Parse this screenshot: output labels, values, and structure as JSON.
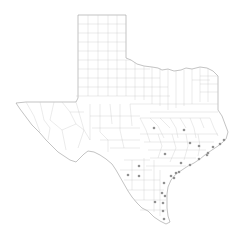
{
  "map": {
    "region": "Texas",
    "subdivision": "counties",
    "colors": {
      "background": "#ffffff",
      "state_outline": "#9a9a9a",
      "county_lines": "#c4c4c4",
      "marker": "#6b6b6b"
    },
    "markers": [
      {
        "x": 154,
        "y": 128
      },
      {
        "x": 184,
        "y": 130
      },
      {
        "x": 190,
        "y": 143
      },
      {
        "x": 199,
        "y": 146
      },
      {
        "x": 165,
        "y": 154
      },
      {
        "x": 213,
        "y": 147
      },
      {
        "x": 220,
        "y": 144
      },
      {
        "x": 224,
        "y": 140
      },
      {
        "x": 207,
        "y": 155
      },
      {
        "x": 208,
        "y": 153
      },
      {
        "x": 199,
        "y": 159
      },
      {
        "x": 181,
        "y": 163
      },
      {
        "x": 190,
        "y": 165
      },
      {
        "x": 139,
        "y": 166
      },
      {
        "x": 128,
        "y": 175
      },
      {
        "x": 139,
        "y": 176
      },
      {
        "x": 171,
        "y": 176
      },
      {
        "x": 176,
        "y": 173
      },
      {
        "x": 179,
        "y": 172
      },
      {
        "x": 174,
        "y": 178
      },
      {
        "x": 164,
        "y": 183
      },
      {
        "x": 162,
        "y": 193
      },
      {
        "x": 165,
        "y": 196
      },
      {
        "x": 155,
        "y": 202
      },
      {
        "x": 163,
        "y": 203
      },
      {
        "x": 163,
        "y": 211
      },
      {
        "x": 164,
        "y": 219
      }
    ]
  }
}
